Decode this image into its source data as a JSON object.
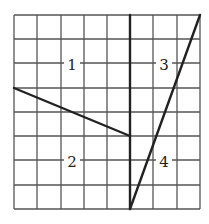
{
  "diagram": {
    "grid": {
      "cols": 8,
      "rows": 8,
      "x_lines": [
        14,
        37,
        61,
        84,
        107,
        130,
        153,
        177,
        200
      ],
      "y_lines": [
        15,
        39,
        63,
        88,
        112,
        136,
        160,
        185,
        209
      ],
      "line_color": "#555555"
    },
    "divider_lines": [
      {
        "name": "vertical-divider",
        "x1": 130,
        "y1": 15,
        "x2": 130,
        "y2": 209
      },
      {
        "name": "sloped-left-line",
        "x1": 14,
        "y1": 88,
        "x2": 130,
        "y2": 136
      },
      {
        "name": "steep-right-line",
        "x1": 130,
        "y1": 209,
        "x2": 200,
        "y2": 15
      }
    ],
    "stroke_color": "#222222",
    "regions": [
      {
        "label": "1",
        "x": 72,
        "y": 64
      },
      {
        "label": "2",
        "x": 72,
        "y": 161
      },
      {
        "label": "3",
        "x": 164,
        "y": 64
      },
      {
        "label": "4",
        "x": 164,
        "y": 161
      }
    ]
  }
}
